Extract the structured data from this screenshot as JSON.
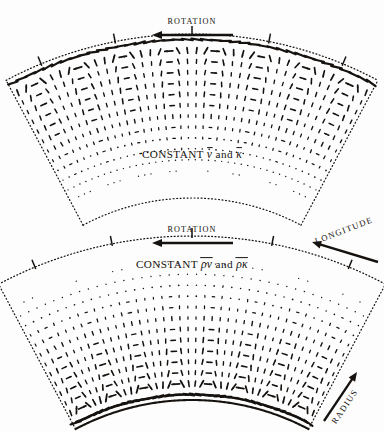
{
  "figure": {
    "type": "vector-field-diagram",
    "background_color": "#fdfdfd",
    "ink_color": "#15120f",
    "panel_count": 2
  },
  "axes": {
    "longitude": {
      "label": "LONGITUDE",
      "arrow_direction": "left",
      "rotation_deg": -21
    },
    "radius": {
      "label": "RADIUS",
      "arrow_direction": "up-right",
      "rotation_deg": -56
    }
  },
  "panels": [
    {
      "id": "upper-panel",
      "rotation_label": "ROTATION",
      "rotation_arrow_direction": "left",
      "caption": {
        "prefix": "CONSTANT",
        "symbol_1": "ν",
        "conjunction": "and",
        "symbol_2": "κ",
        "overbars": true,
        "full_text": "CONSTANT ν̄ and κ̄"
      },
      "geometry": {
        "cx": 192,
        "cy": 430,
        "r_inner": 232,
        "r_outer": 396,
        "angle_start_deg": -118,
        "angle_end_deg": -62
      },
      "boundary_style": {
        "outer_arc": "dotted-with-ticks",
        "inner_arc": "dotted",
        "sides": "dotted"
      },
      "tick_count": 5,
      "flow": {
        "cells": 4,
        "surface_band": "strong",
        "dense_edge": "outer",
        "fade_edge": "inner",
        "max_arrow_px": 9.5
      }
    },
    {
      "id": "lower-panel",
      "rotation_label": "ROTATION",
      "rotation_arrow_direction": "left",
      "caption": {
        "prefix": "CONSTANT",
        "symbol_1": "ρν",
        "conjunction": "and",
        "symbol_2": "ρκ",
        "overbars": true,
        "full_text": "CONSTANT ρ̄ν̄ and ρ̄κ̄"
      },
      "geometry": {
        "cx": 192,
        "cy": 648,
        "r_inner": 248,
        "r_outer": 412,
        "angle_start_deg": -118,
        "angle_end_deg": -62
      },
      "boundary_style": {
        "outer_arc": "dotted-with-ticks",
        "inner_arc": "solid-dark",
        "sides": "dotted"
      },
      "tick_count": 5,
      "flow": {
        "cells": 4,
        "surface_band": "strong",
        "dense_edge": "inner",
        "fade_edge": "outer",
        "max_arrow_px": 9.5
      }
    }
  ]
}
